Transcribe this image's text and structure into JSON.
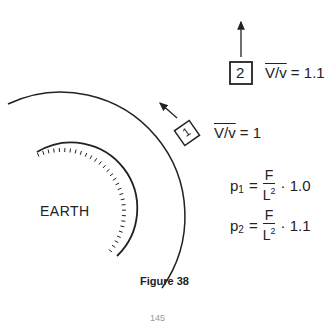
{
  "figure": {
    "caption": "Figure 38",
    "page_number": "145",
    "earth_label": "EARTH",
    "satellites": [
      {
        "id": "1",
        "velocity_label": "V/v",
        "equals": "=",
        "velocity_ratio": "1",
        "motion": "tangential"
      },
      {
        "id": "2",
        "velocity_label": "V/v",
        "equals": "=",
        "velocity_ratio": "1.1",
        "motion": "upward"
      }
    ],
    "equations": [
      {
        "lhs": "p",
        "subscript": "1",
        "numerator": "F",
        "denominator": "L",
        "exponent": "2",
        "factor": "1.0"
      },
      {
        "lhs": "p",
        "subscript": "2",
        "numerator": "F",
        "denominator": "L",
        "exponent": "2",
        "factor": "1.1"
      }
    ],
    "colors": {
      "ink": "#222222",
      "background": "#ffffff"
    }
  }
}
